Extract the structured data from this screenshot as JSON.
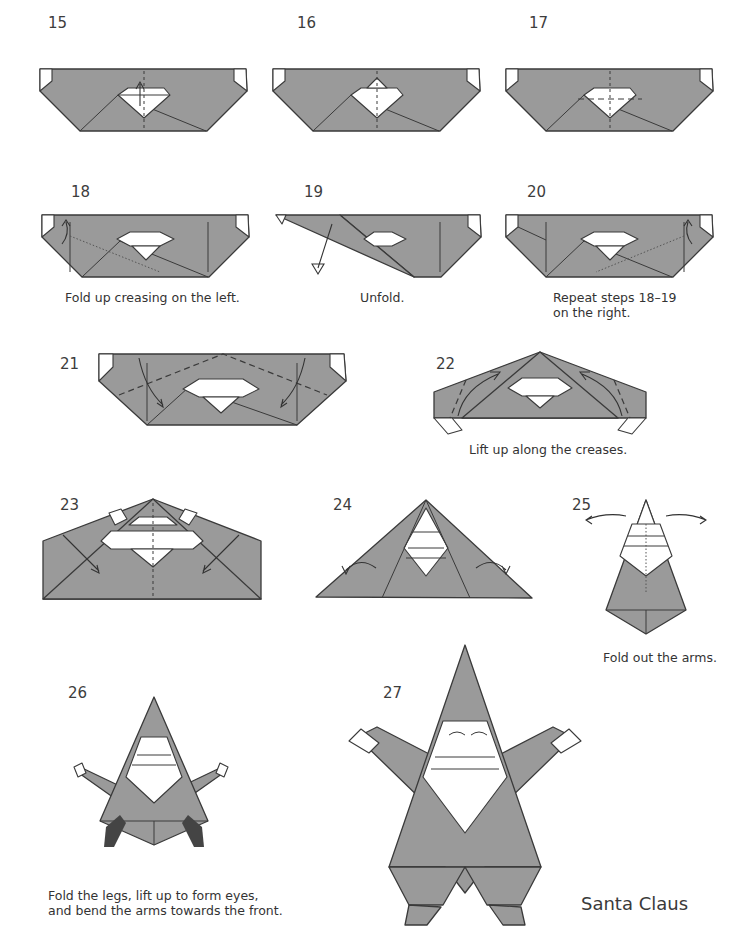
{
  "page": {
    "title": "Santa Claus"
  },
  "steps": [
    {
      "number": "15",
      "caption": ""
    },
    {
      "number": "16",
      "caption": ""
    },
    {
      "number": "17",
      "caption": ""
    },
    {
      "number": "18",
      "caption": "Fold up creasing on the left."
    },
    {
      "number": "19",
      "caption": "Unfold."
    },
    {
      "number": "20",
      "caption": "Repeat steps 18–19\non the right."
    },
    {
      "number": "21",
      "caption": ""
    },
    {
      "number": "22",
      "caption": "Lift up along the creases."
    },
    {
      "number": "23",
      "caption": ""
    },
    {
      "number": "24",
      "caption": ""
    },
    {
      "number": "25",
      "caption": "Fold out the arms."
    },
    {
      "number": "26",
      "caption": "Fold the legs, lift up to form eyes,\nand bend the arms towards the front."
    },
    {
      "number": "27",
      "caption": ""
    }
  ],
  "colors": {
    "paper": "#9a9a9a",
    "line": "#3a3a3a",
    "background": "#ffffff"
  }
}
